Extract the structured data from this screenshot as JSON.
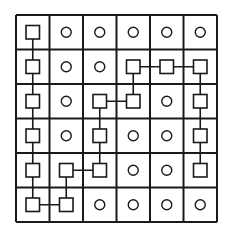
{
  "diagram": {
    "title": "",
    "rows": 6,
    "cols": 6,
    "cells": [
      [
        "square",
        "circle",
        "circle",
        "circle",
        "circle",
        "circle"
      ],
      [
        "square",
        "circle",
        "circle",
        "square",
        "square",
        "square"
      ],
      [
        "square",
        "circle",
        "square",
        "square",
        "circle",
        "square"
      ],
      [
        "square",
        "circle",
        "square",
        "circle",
        "circle",
        "square"
      ],
      [
        "square",
        "square",
        "square",
        "circle",
        "circle",
        "square"
      ],
      [
        "square",
        "square",
        "circle",
        "circle",
        "circle",
        "circle"
      ]
    ],
    "path": [
      [
        0,
        0
      ],
      [
        1,
        0
      ],
      [
        2,
        0
      ],
      [
        3,
        0
      ],
      [
        4,
        0
      ],
      [
        5,
        0
      ],
      [
        5,
        1
      ],
      [
        4,
        1
      ],
      [
        4,
        2
      ],
      [
        3,
        2
      ],
      [
        2,
        2
      ],
      [
        2,
        3
      ],
      [
        1,
        3
      ],
      [
        1,
        4
      ],
      [
        1,
        5
      ],
      [
        2,
        5
      ],
      [
        3,
        5
      ],
      [
        4,
        5
      ]
    ],
    "colors": {
      "line": "#1a1a1a",
      "background": "#ffffff"
    }
  }
}
